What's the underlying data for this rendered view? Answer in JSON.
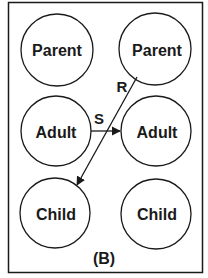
{
  "figure": {
    "panel_label": "(B)",
    "stroke_color": "#1a1a1a",
    "background_color": "#ffffff",
    "nodes": [
      {
        "id": "parent-left",
        "label": "Parent",
        "cx": 57,
        "cy": 50,
        "r": 36
      },
      {
        "id": "parent-right",
        "label": "Parent",
        "cx": 155,
        "cy": 49,
        "r": 36
      },
      {
        "id": "adult-left",
        "label": "Adult",
        "cx": 56,
        "cy": 131,
        "r": 35
      },
      {
        "id": "adult-right",
        "label": "Adult",
        "cx": 156,
        "cy": 131,
        "r": 35
      },
      {
        "id": "child-left",
        "label": "Child",
        "cx": 55,
        "cy": 213,
        "r": 35
      },
      {
        "id": "child-right",
        "label": "Child",
        "cx": 156,
        "cy": 214,
        "r": 35
      }
    ],
    "edges": [
      {
        "id": "edge-s",
        "label": "S",
        "from": "adult-left",
        "to": "adult-right"
      },
      {
        "id": "edge-r",
        "label": "R",
        "from": "parent-right",
        "to": "child-left"
      }
    ]
  }
}
